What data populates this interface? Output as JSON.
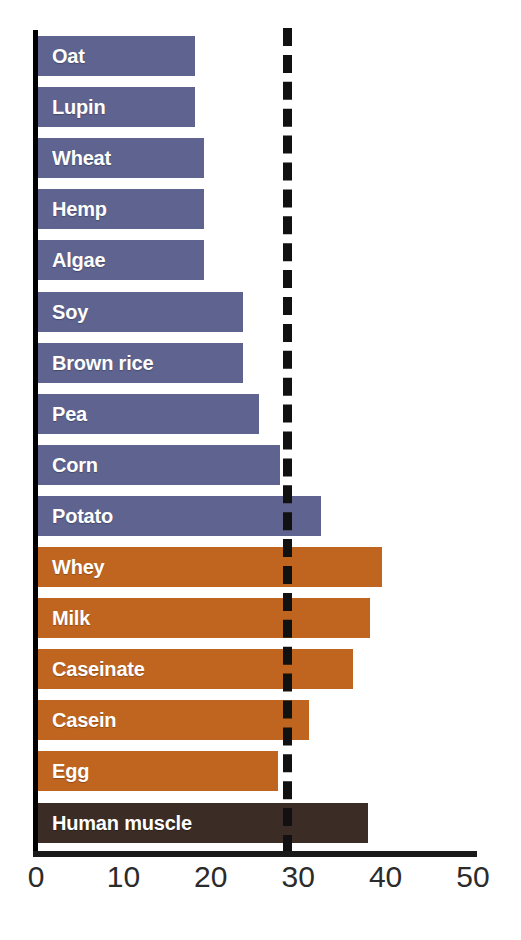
{
  "chart_data": {
    "type": "bar",
    "orientation": "horizontal",
    "title": "",
    "subtitle": "",
    "xlabel": "",
    "ylabel": "",
    "xlim": [
      0,
      50
    ],
    "grid": false,
    "legend": "none",
    "x_ticks": [
      0,
      10,
      20,
      30,
      40,
      50
    ],
    "x_tick_labels": [
      "0",
      "10",
      "20",
      "30",
      "40",
      "50"
    ],
    "categories": [
      "Oat",
      "Lupin",
      "Wheat",
      "Hemp",
      "Algae",
      "Soy",
      "Brown rice",
      "Pea",
      "Corn",
      "Potato",
      "Whey",
      "Milk",
      "Caseinate",
      "Casein",
      "Egg",
      "Human muscle"
    ],
    "values": [
      18.0,
      18.0,
      19.0,
      19.0,
      19.0,
      23.5,
      23.5,
      25.3,
      27.7,
      32.4,
      39.4,
      38.0,
      36.0,
      31.0,
      27.5,
      37.8
    ],
    "bar_groups": [
      "plant",
      "plant",
      "plant",
      "plant",
      "plant",
      "plant",
      "plant",
      "plant",
      "plant",
      "plant",
      "animal",
      "animal",
      "animal",
      "animal",
      "animal",
      "reference"
    ],
    "annotations": [
      {
        "type": "reference-line",
        "style": "dashed",
        "orientation": "vertical",
        "value": 28.3,
        "color": "#111111"
      }
    ],
    "colors": {
      "plant": "#5E638F",
      "animal": "#C0651F",
      "reference": "#3B2C26",
      "axis": "#111111",
      "label_text": "#FFFFFF",
      "tick_text": "#2B2B2B",
      "background": "#FFFFFF"
    }
  },
  "axis": {
    "pixel_zero": 36,
    "pixel_per_unit": 8.74
  }
}
